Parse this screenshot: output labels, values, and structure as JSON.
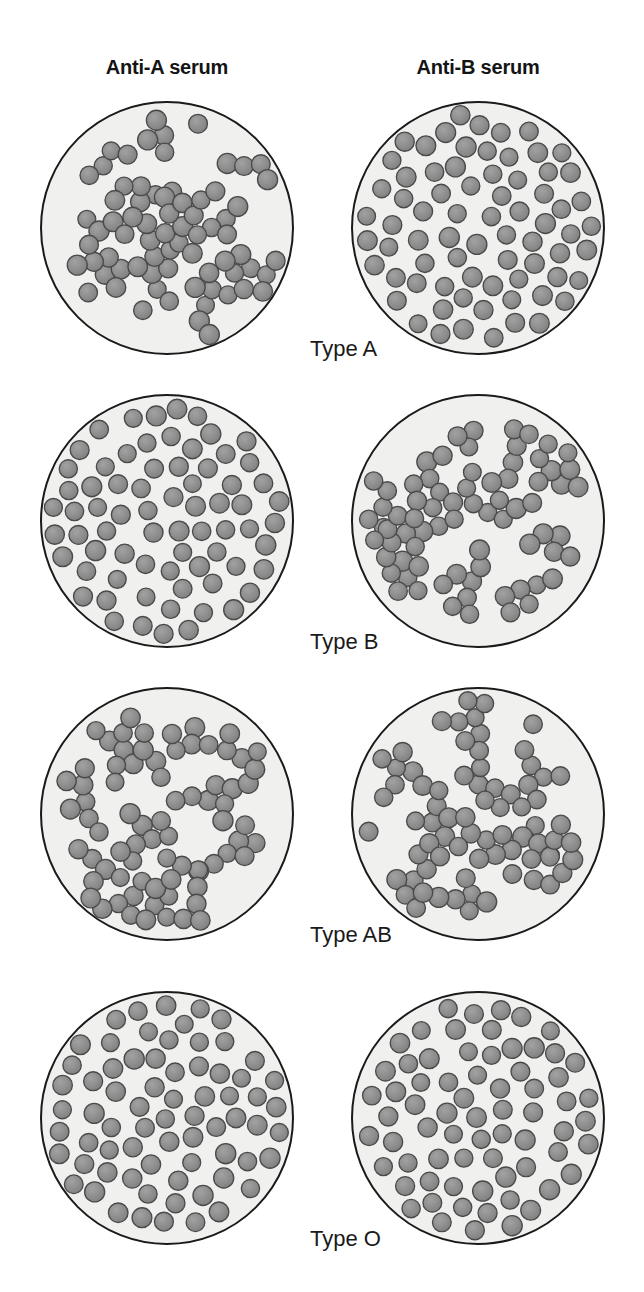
{
  "figure": {
    "title_row": {
      "columns": [
        {
          "id": "anti-a",
          "label": "Anti-A serum",
          "center_x": 167,
          "y": 56
        },
        {
          "id": "anti-b",
          "label": "Anti-B serum",
          "center_x": 478,
          "y": 56
        }
      ]
    },
    "row_labels": [
      {
        "id": "type-a",
        "label": "Type A",
        "x": 310,
        "y": 336
      },
      {
        "id": "type-b",
        "label": "Type B",
        "x": 310,
        "y": 629
      },
      {
        "id": "type-ab",
        "label": "Type AB",
        "x": 310,
        "y": 922
      },
      {
        "id": "type-o",
        "label": "Type O",
        "x": 310,
        "y": 1226
      }
    ],
    "geometry": {
      "plate_radius": 126,
      "column_centers_x": [
        167,
        478
      ],
      "row_centers_y": [
        228,
        521,
        814,
        1118
      ],
      "cell_radius": 9.5
    },
    "colors": {
      "page_background": "#ffffff",
      "plate_fill": "#f0f0ee",
      "plate_stroke": "#1a1a1a",
      "cell_fill": "#8e8e8e",
      "cell_stroke": "#4a4a4a",
      "text": "#141414"
    },
    "plates": [
      {
        "id": "type-a-anti-a",
        "blood_type": "Type A",
        "serum": "Anti-A serum",
        "column": 0,
        "row": 0,
        "reaction": "agglutination",
        "pattern": "clumped",
        "cell_count": 72,
        "cluster_count": 12,
        "seed": 101
      },
      {
        "id": "type-a-anti-b",
        "blood_type": "Type A",
        "serum": "Anti-B serum",
        "column": 1,
        "row": 0,
        "reaction": "no-agglutination",
        "pattern": "dispersed",
        "cell_count": 76,
        "cluster_count": 0,
        "seed": 202
      },
      {
        "id": "type-b-anti-a",
        "blood_type": "Type B",
        "serum": "Anti-A serum",
        "column": 0,
        "row": 1,
        "reaction": "no-agglutination",
        "pattern": "dispersed",
        "cell_count": 72,
        "cluster_count": 0,
        "seed": 303
      },
      {
        "id": "type-b-anti-b",
        "blood_type": "Type B",
        "serum": "Anti-B serum",
        "column": 1,
        "row": 1,
        "reaction": "agglutination",
        "pattern": "clumped",
        "cell_count": 74,
        "cluster_count": 12,
        "seed": 404
      },
      {
        "id": "type-ab-anti-a",
        "blood_type": "Type AB",
        "serum": "Anti-A serum",
        "column": 0,
        "row": 2,
        "reaction": "agglutination",
        "pattern": "clumped",
        "cell_count": 76,
        "cluster_count": 12,
        "seed": 505
      },
      {
        "id": "type-ab-anti-b",
        "blood_type": "Type AB",
        "serum": "Anti-B serum",
        "column": 1,
        "row": 2,
        "reaction": "agglutination",
        "pattern": "clumped",
        "cell_count": 74,
        "cluster_count": 12,
        "seed": 606
      },
      {
        "id": "type-o-anti-a",
        "blood_type": "Type O",
        "serum": "Anti-A serum",
        "column": 0,
        "row": 3,
        "reaction": "no-agglutination",
        "pattern": "dispersed",
        "cell_count": 70,
        "cluster_count": 0,
        "seed": 707
      },
      {
        "id": "type-o-anti-b",
        "blood_type": "Type O",
        "serum": "Anti-B serum",
        "column": 1,
        "row": 3,
        "reaction": "no-agglutination",
        "pattern": "dispersed",
        "cell_count": 70,
        "cluster_count": 0,
        "seed": 808
      }
    ]
  }
}
